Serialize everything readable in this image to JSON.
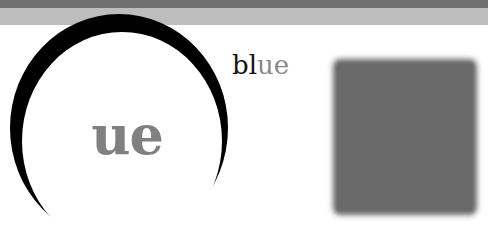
{
  "colors": {
    "top_bar_dark": "#6f6f6f",
    "top_bar_light": "#bdbdbd",
    "ring": "#000000",
    "ring_text": "#808080",
    "label_dark": "#111111",
    "label_gray": "#8a8a8a",
    "square": "#6a6a6a",
    "background": "#ffffff"
  },
  "circle": {
    "text": "ue"
  },
  "label": {
    "part_dark": "bl",
    "part_gray": "ue"
  },
  "square": {
    "shape": "blurred-gray-square"
  }
}
